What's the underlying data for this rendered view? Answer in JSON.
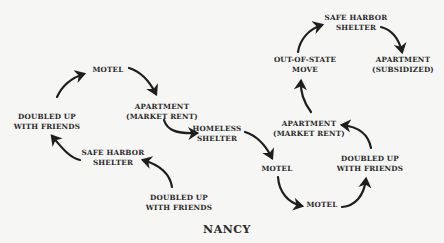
{
  "title": "NANCY",
  "nodes": [
    {
      "id": "motel_1",
      "lines": [
        "MOTEL"
      ],
      "x": 108,
      "y": 70
    },
    {
      "id": "doubled_up_1",
      "lines": [
        "DOUBLED UP",
        "WITH FRIENDS"
      ],
      "x": 47,
      "y": 121
    },
    {
      "id": "apartment_market_1",
      "lines": [
        "APARTMENT",
        "(MARKET RENT)"
      ],
      "x": 162,
      "y": 111
    },
    {
      "id": "homeless_shelter",
      "lines": [
        "HOMELESS",
        "SHELTER"
      ],
      "x": 217,
      "y": 133
    },
    {
      "id": "safe_harbor_1",
      "lines": [
        "SAFE HARBOR",
        "SHELTER"
      ],
      "x": 113,
      "y": 157
    },
    {
      "id": "doubled_up_2",
      "lines": [
        "DOUBLED UP",
        "WITH FRIENDS"
      ],
      "x": 179,
      "y": 202
    },
    {
      "id": "motel_2",
      "lines": [
        "MOTEL"
      ],
      "x": 277,
      "y": 169
    },
    {
      "id": "motel_3",
      "lines": [
        "MOTEL"
      ],
      "x": 329,
      "y": 205
    },
    {
      "id": "doubled_up_3",
      "lines": [
        "DOUBLED UP",
        "WITH FRIENDS"
      ],
      "x": 370,
      "y": 163
    },
    {
      "id": "apartment_market_2",
      "lines": [
        "APARTMENT",
        "(MARKET RENT)"
      ],
      "x": 309,
      "y": 128
    },
    {
      "id": "out_of_state",
      "lines": [
        "OUT-OF-STATE",
        "MOVE"
      ],
      "x": 305,
      "y": 64
    },
    {
      "id": "safe_harbor_2",
      "lines": [
        "SAFE HARBOR",
        "SHELTER"
      ],
      "x": 356,
      "y": 22
    },
    {
      "id": "apartment_subsidized",
      "lines": [
        "APARTMENT",
        "(SUBSIDIZED)"
      ],
      "x": 403,
      "y": 64
    }
  ],
  "edges": [
    {
      "from": "doubled_up_2",
      "to": "safe_harbor_1",
      "d": "M172,187 C170,174 160,165 143,160"
    },
    {
      "from": "safe_harbor_1",
      "to": "doubled_up_1",
      "d": "M80,160 C70,158 62,148 52,136"
    },
    {
      "from": "doubled_up_1",
      "to": "motel_1",
      "d": "M57,97 C62,86 71,78 84,74"
    },
    {
      "from": "motel_1",
      "to": "apartment_market_1",
      "d": "M129,68 C142,72 150,82 156,94"
    },
    {
      "from": "apartment_market_1",
      "to": "homeless_shelter",
      "d": "M164,120 C167,130 176,134 197,133"
    },
    {
      "from": "homeless_shelter",
      "to": "motel_2",
      "d": "M245,132 C258,136 266,146 272,158"
    },
    {
      "from": "motel_2",
      "to": "motel_3",
      "d": "M278,177 C279,192 288,203 302,206"
    },
    {
      "from": "motel_3",
      "to": "doubled_up_3",
      "d": "M342,207 C355,206 364,196 366,179"
    },
    {
      "from": "doubled_up_3",
      "to": "apartment_market_2",
      "d": "M371,148 C369,137 361,127 342,125"
    },
    {
      "from": "apartment_market_2",
      "to": "out_of_state",
      "d": "M311,112 C305,104 300,95 301,81"
    },
    {
      "from": "out_of_state",
      "to": "safe_harbor_2",
      "d": "M298,52 C300,39 309,29 322,25"
    },
    {
      "from": "safe_harbor_2",
      "to": "apartment_subsidized",
      "d": "M381,27 C392,30 399,39 402,52"
    }
  ],
  "colors": {
    "background": "#f6f6f4",
    "text": "#2b2b2b",
    "arrow": "#1e1e1e"
  }
}
